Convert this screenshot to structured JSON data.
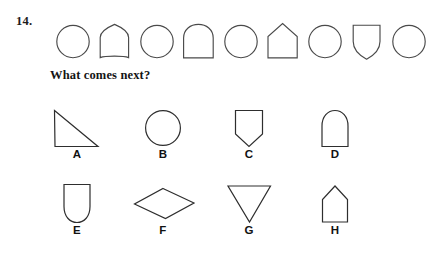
{
  "question": {
    "number": "14.",
    "prompt": "What comes next?"
  },
  "sequence": {
    "shapes": [
      {
        "index": 1,
        "name": "circle"
      },
      {
        "index": 2,
        "name": "pointed-arch"
      },
      {
        "index": 3,
        "name": "circle"
      },
      {
        "index": 4,
        "name": "round-arch"
      },
      {
        "index": 5,
        "name": "circle"
      },
      {
        "index": 6,
        "name": "house-pentagon"
      },
      {
        "index": 7,
        "name": "circle"
      },
      {
        "index": 8,
        "name": "shield"
      },
      {
        "index": 9,
        "name": "circle"
      }
    ]
  },
  "options": [
    {
      "letter": "A",
      "shape": "triangle"
    },
    {
      "letter": "B",
      "shape": "circle"
    },
    {
      "letter": "C",
      "shape": "shield"
    },
    {
      "letter": "D",
      "shape": "round-arch"
    },
    {
      "letter": "E",
      "shape": "u-shape"
    },
    {
      "letter": "F",
      "shape": "rhombus"
    },
    {
      "letter": "G",
      "shape": "inverted-triangle"
    },
    {
      "letter": "H",
      "shape": "house-pentagon"
    }
  ],
  "colors": {
    "background": "#ffffff",
    "stroke": "#4a4a4a",
    "stroke_dark": "#2e2e2e",
    "text": "#1a1a1a"
  }
}
